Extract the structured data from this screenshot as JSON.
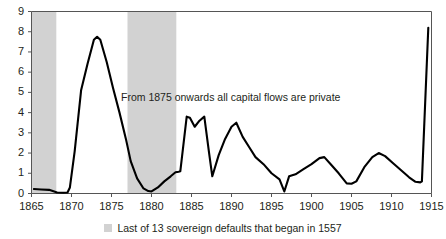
{
  "chart_data": {
    "type": "line",
    "title": "",
    "subtitle": "",
    "xlabel": "",
    "ylabel": "",
    "xlim": [
      1865,
      1915
    ],
    "ylim": [
      0,
      9
    ],
    "grid": false,
    "legend_position": "bottom-center",
    "x_ticks": [
      1865,
      1870,
      1875,
      1880,
      1885,
      1890,
      1895,
      1900,
      1905,
      1910,
      1915
    ],
    "y_ticks": [
      0,
      1,
      2,
      3,
      4,
      5,
      6,
      7,
      8,
      9
    ],
    "series": [
      {
        "name": "Capital flows",
        "color": "#000000",
        "x": [
          1865.3,
          1866.2,
          1867.2,
          1868.2,
          1869.0,
          1869.5,
          1869.8,
          1870.4,
          1871.2,
          1872.0,
          1872.8,
          1873.2,
          1873.6,
          1874.4,
          1875.2,
          1876.0,
          1876.8,
          1877.4,
          1878.2,
          1879.0,
          1879.6,
          1880.0,
          1880.8,
          1881.6,
          1882.4,
          1883.0,
          1883.4,
          1883.6,
          1884.4,
          1884.8,
          1885.4,
          1886.0,
          1886.6,
          1887.2,
          1887.6,
          1888.4,
          1889.2,
          1890.0,
          1890.6,
          1891.4,
          1892.2,
          1893.0,
          1894.0,
          1895.0,
          1896.0,
          1896.6,
          1897.2,
          1898.0,
          1899.0,
          1900.0,
          1901.0,
          1901.6,
          1902.4,
          1903.4,
          1904.4,
          1905.0,
          1905.6,
          1906.6,
          1907.6,
          1908.4,
          1909.2,
          1910.2,
          1911.2,
          1912.2,
          1913.0,
          1913.6,
          1913.8,
          1914.6
        ],
        "y": [
          0.22,
          0.2,
          0.18,
          0.05,
          0.04,
          0.05,
          0.3,
          2.1,
          5.1,
          6.4,
          7.6,
          7.75,
          7.6,
          6.5,
          5.2,
          4.0,
          2.7,
          1.6,
          0.75,
          0.25,
          0.12,
          0.1,
          0.3,
          0.6,
          0.85,
          1.05,
          1.08,
          1.1,
          3.8,
          3.75,
          3.3,
          3.6,
          3.8,
          2.0,
          0.85,
          1.9,
          2.7,
          3.3,
          3.5,
          2.8,
          2.3,
          1.8,
          1.45,
          1.0,
          0.7,
          0.1,
          0.85,
          0.95,
          1.2,
          1.45,
          1.75,
          1.8,
          1.45,
          1.0,
          0.5,
          0.48,
          0.6,
          1.3,
          1.8,
          2.0,
          1.85,
          1.5,
          1.15,
          0.8,
          0.58,
          0.55,
          0.6,
          8.2
        ]
      }
    ],
    "shaded_bands": [
      {
        "name": "default-band-1",
        "x_start": 1865.0,
        "x_end": 1868.1,
        "color": "#d2d2d2"
      },
      {
        "name": "default-band-2",
        "x_start": 1877.0,
        "x_end": 1883.1,
        "color": "#d2d2d2"
      }
    ],
    "annotations": [
      {
        "name": "capital-flows-note",
        "text": "From 1875 onwards all capital flows are private",
        "x": 1875,
        "y": 4.4
      }
    ],
    "legend": [
      {
        "label": "Last of 13 sovereign defaults that began in 1557",
        "swatch_color": "#d2d2d2"
      }
    ]
  },
  "axes": {
    "y_tick_labels": [
      "9",
      "8",
      "7",
      "6",
      "5",
      "4",
      "3",
      "2",
      "1",
      "0"
    ],
    "x_tick_labels": [
      "1865",
      "1870",
      "1875",
      "1880",
      "1885",
      "1890",
      "1895",
      "1900",
      "1905",
      "1910",
      "1915"
    ]
  },
  "annotation": {
    "text": "From 1875 onwards all capital flows are private"
  },
  "legend": {
    "label": "Last of 13 sovereign defaults that began in 1557"
  }
}
